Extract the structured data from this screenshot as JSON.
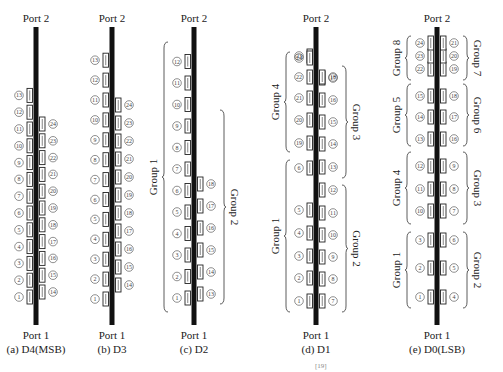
{
  "port_top": "Port 2",
  "port_bottom": "Port 1",
  "panels": [
    {
      "id": "a",
      "caption": "(a)  D4(MSB)",
      "cx": 36,
      "bar": [
        27,
        325
      ],
      "left": {
        "from": 1,
        "to": 13,
        "y0": 297,
        "dy": 16.8
      },
      "right": {
        "from": 14,
        "to": 24,
        "y0": 292,
        "dy": 16.8
      },
      "groups": []
    },
    {
      "id": "b",
      "caption": "(b)  D3",
      "cx": 112,
      "bar": [
        27,
        325
      ],
      "left": {
        "from": 1,
        "to": 13,
        "y0": 299,
        "dy": 19.9
      },
      "right": {
        "from": 14,
        "to": 24,
        "y0": 285,
        "dy": 18.0
      },
      "groups": []
    },
    {
      "id": "c",
      "caption": "(c)  D2",
      "cx": 194,
      "bar": [
        27,
        325
      ],
      "left": {
        "from": 1,
        "to": 12,
        "y0": 298,
        "dy": 21.5
      },
      "right": {
        "from": 13,
        "to": 18,
        "y0": 294,
        "dy": 22.0
      },
      "groups": [
        {
          "label": "Group 1",
          "side": "left",
          "y1": 42,
          "y2": 312
        },
        {
          "label": "Group 2",
          "side": "right",
          "y1": 110,
          "y2": 304
        }
      ]
    },
    {
      "id": "d",
      "caption": "(d)  D1",
      "cx": 316,
      "bar": [
        27,
        325
      ],
      "left": {
        "items": [
          [
            1,
            301
          ],
          [
            2,
            278
          ],
          [
            3,
            256
          ],
          [
            4,
            233
          ],
          [
            5,
            210
          ],
          [
            6,
            168
          ],
          [
            19,
            143
          ],
          [
            20,
            120
          ],
          [
            21,
            98
          ],
          [
            22,
            77
          ],
          [
            23,
            56
          ],
          [
            24,
            58
          ]
        ]
      },
      "right": {
        "items": [
          [
            7,
            301
          ],
          [
            8,
            279
          ],
          [
            9,
            257
          ],
          [
            10,
            235
          ],
          [
            11,
            213
          ],
          [
            12,
            190
          ],
          [
            13,
            167
          ],
          [
            14,
            144
          ],
          [
            15,
            122
          ],
          [
            16,
            100
          ],
          [
            17,
            78
          ],
          [
            18,
            77
          ]
        ]
      },
      "groups": [
        {
          "label": "Group 1",
          "side": "left",
          "y1": 160,
          "y2": 312
        },
        {
          "label": "Group 2",
          "side": "right",
          "y1": 185,
          "y2": 312
        },
        {
          "label": "Group 3",
          "side": "right",
          "y1": 66,
          "y2": 178
        },
        {
          "label": "Group 4",
          "side": "left",
          "y1": 52,
          "y2": 152
        }
      ]
    },
    {
      "id": "e",
      "caption": "(e)  D0(LSB)",
      "cx": 437,
      "bar": [
        27,
        325
      ],
      "left": {
        "items": [
          [
            1,
            297
          ],
          [
            2,
            268
          ],
          [
            3,
            240
          ],
          [
            10,
            211
          ],
          [
            11,
            189
          ],
          [
            12,
            166
          ],
          [
            13,
            139
          ],
          [
            14,
            117
          ],
          [
            15,
            96
          ],
          [
            22,
            69
          ],
          [
            23,
            56
          ],
          [
            24,
            43
          ]
        ]
      },
      "right": {
        "items": [
          [
            4,
            297
          ],
          [
            5,
            268
          ],
          [
            6,
            240
          ],
          [
            7,
            211
          ],
          [
            8,
            189
          ],
          [
            9,
            166
          ],
          [
            16,
            139
          ],
          [
            17,
            117
          ],
          [
            18,
            96
          ],
          [
            19,
            69
          ],
          [
            20,
            56
          ],
          [
            21,
            43
          ]
        ]
      },
      "groups": [
        {
          "label": "Group 1",
          "side": "left",
          "y1": 232,
          "y2": 308
        },
        {
          "label": "Group 2",
          "side": "right",
          "y1": 232,
          "y2": 308
        },
        {
          "label": "Group 3",
          "side": "right",
          "y1": 152,
          "y2": 224
        },
        {
          "label": "Group 4",
          "side": "left",
          "y1": 152,
          "y2": 224
        },
        {
          "label": "Group 5",
          "side": "left",
          "y1": 84,
          "y2": 146
        },
        {
          "label": "Group 6",
          "side": "right",
          "y1": 84,
          "y2": 146
        },
        {
          "label": "Group 7",
          "side": "right",
          "y1": 36,
          "y2": 80
        },
        {
          "label": "Group 8",
          "side": "left",
          "y1": 36,
          "y2": 80
        }
      ]
    }
  ],
  "figure_caption_fragment": "[19]"
}
